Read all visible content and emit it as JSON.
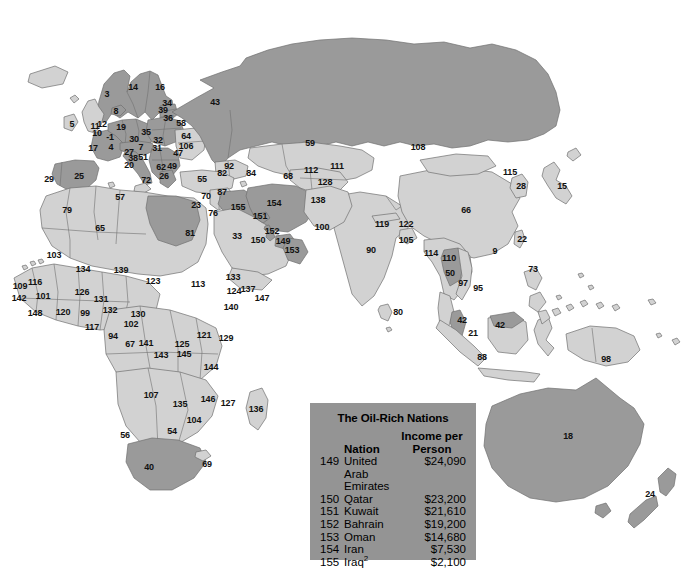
{
  "figure": {
    "kind": "world-map",
    "width": 693,
    "height": 579
  },
  "palette": {
    "ocean": "#ffffff",
    "land_light": "#d2d2d2",
    "land_dark": "#9a9a9a",
    "border": "#6e6e6e",
    "legend_bg": "#949494",
    "text": "#111111"
  },
  "legend": {
    "title": "The Oil-Rich Nations",
    "headers": {
      "rank": "",
      "nation": "Nation",
      "income_line1": "Income per",
      "income_line2": "Person"
    },
    "rows": [
      {
        "rank": "149",
        "nation": "United Arab Emirates",
        "income": "$24,090"
      },
      {
        "rank": "150",
        "nation": "Qatar",
        "income": "$23,200"
      },
      {
        "rank": "151",
        "nation": "Kuwait",
        "income": "$21,610"
      },
      {
        "rank": "152",
        "nation": "Bahrain",
        "income": "$19,200"
      },
      {
        "rank": "153",
        "nation": "Oman",
        "income": "$14,680"
      },
      {
        "rank": "154",
        "nation": "Iran",
        "income": "$7,530"
      },
      {
        "rank": "155",
        "nation": "Iraq",
        "income": "$2,100",
        "footnote": "2"
      }
    ]
  },
  "map_labels": [
    {
      "n": "5",
      "x": 72,
      "y": 124
    },
    {
      "n": "11",
      "x": 95,
      "y": 126
    },
    {
      "n": "3",
      "x": 107,
      "y": 94
    },
    {
      "n": "14",
      "x": 133,
      "y": 87
    },
    {
      "n": "16",
      "x": 160,
      "y": 87
    },
    {
      "n": "8",
      "x": 116,
      "y": 111
    },
    {
      "n": "12",
      "x": 102,
      "y": 124
    },
    {
      "n": "19",
      "x": 121,
      "y": 127
    },
    {
      "n": "34",
      "x": 167,
      "y": 103
    },
    {
      "n": "39",
      "x": 163,
      "y": 110
    },
    {
      "n": "36",
      "x": 168,
      "y": 118
    },
    {
      "n": "58",
      "x": 181,
      "y": 123
    },
    {
      "n": "43",
      "x": 215,
      "y": 102
    },
    {
      "n": "10",
      "x": 97,
      "y": 133
    },
    {
      "n": "-1",
      "x": 110,
      "y": 137
    },
    {
      "n": "35",
      "x": 146,
      "y": 132
    },
    {
      "n": "30",
      "x": 134,
      "y": 139
    },
    {
      "n": "32",
      "x": 158,
      "y": 140
    },
    {
      "n": "64",
      "x": 186,
      "y": 136
    },
    {
      "n": "106",
      "x": 186,
      "y": 146
    },
    {
      "n": "17",
      "x": 93,
      "y": 148
    },
    {
      "n": "4",
      "x": 111,
      "y": 147
    },
    {
      "n": "7",
      "x": 141,
      "y": 147
    },
    {
      "n": "31",
      "x": 157,
      "y": 148
    },
    {
      "n": "27",
      "x": 129,
      "y": 152
    },
    {
      "n": "47",
      "x": 178,
      "y": 153
    },
    {
      "n": "51",
      "x": 143,
      "y": 157
    },
    {
      "n": "38",
      "x": 133,
      "y": 158
    },
    {
      "n": "20",
      "x": 129,
      "y": 165
    },
    {
      "n": "62",
      "x": 161,
      "y": 167
    },
    {
      "n": "49",
      "x": 172,
      "y": 166
    },
    {
      "n": "26",
      "x": 164,
      "y": 176
    },
    {
      "n": "72",
      "x": 146,
      "y": 180
    },
    {
      "n": "29",
      "x": 49,
      "y": 179
    },
    {
      "n": "25",
      "x": 79,
      "y": 176
    },
    {
      "n": "55",
      "x": 202,
      "y": 179
    },
    {
      "n": "92",
      "x": 229,
      "y": 166
    },
    {
      "n": "82",
      "x": 222,
      "y": 173
    },
    {
      "n": "84",
      "x": 251,
      "y": 173
    },
    {
      "n": "68",
      "x": 288,
      "y": 176
    },
    {
      "n": "112",
      "x": 311,
      "y": 170
    },
    {
      "n": "111",
      "x": 337,
      "y": 166
    },
    {
      "n": "128",
      "x": 325,
      "y": 182
    },
    {
      "n": "59",
      "x": 310,
      "y": 143
    },
    {
      "n": "108",
      "x": 418,
      "y": 147
    },
    {
      "n": "115",
      "x": 510,
      "y": 172
    },
    {
      "n": "28",
      "x": 521,
      "y": 186
    },
    {
      "n": "15",
      "x": 562,
      "y": 186
    },
    {
      "n": "70",
      "x": 206,
      "y": 196
    },
    {
      "n": "87",
      "x": 222,
      "y": 192
    },
    {
      "n": "23",
      "x": 196,
      "y": 205
    },
    {
      "n": "76",
      "x": 213,
      "y": 213
    },
    {
      "n": "155",
      "x": 238,
      "y": 207
    },
    {
      "n": "151",
      "x": 260,
      "y": 216
    },
    {
      "n": "154",
      "x": 274,
      "y": 203
    },
    {
      "n": "138",
      "x": 318,
      "y": 200
    },
    {
      "n": "100",
      "x": 322,
      "y": 227
    },
    {
      "n": "119",
      "x": 382,
      "y": 224
    },
    {
      "n": "122",
      "x": 406,
      "y": 224
    },
    {
      "n": "105",
      "x": 406,
      "y": 240
    },
    {
      "n": "57",
      "x": 120,
      "y": 197
    },
    {
      "n": "79",
      "x": 67,
      "y": 210
    },
    {
      "n": "65",
      "x": 100,
      "y": 228
    },
    {
      "n": "81",
      "x": 190,
      "y": 233
    },
    {
      "n": "33",
      "x": 237,
      "y": 236
    },
    {
      "n": "150",
      "x": 258,
      "y": 240
    },
    {
      "n": "152",
      "x": 272,
      "y": 231
    },
    {
      "n": "149",
      "x": 283,
      "y": 241
    },
    {
      "n": "153",
      "x": 292,
      "y": 250
    },
    {
      "n": "66",
      "x": 466,
      "y": 210
    },
    {
      "n": "22",
      "x": 522,
      "y": 239
    },
    {
      "n": "9",
      "x": 495,
      "y": 251
    },
    {
      "n": "73",
      "x": 533,
      "y": 269
    },
    {
      "n": "90",
      "x": 371,
      "y": 250
    },
    {
      "n": "114",
      "x": 431,
      "y": 253
    },
    {
      "n": "110",
      "x": 449,
      "y": 258
    },
    {
      "n": "103",
      "x": 54,
      "y": 255
    },
    {
      "n": "134",
      "x": 83,
      "y": 269
    },
    {
      "n": "139",
      "x": 121,
      "y": 270
    },
    {
      "n": "123",
      "x": 153,
      "y": 281
    },
    {
      "n": "113",
      "x": 198,
      "y": 284
    },
    {
      "n": "133",
      "x": 233,
      "y": 277
    },
    {
      "n": "137",
      "x": 248,
      "y": 289
    },
    {
      "n": "124",
      "x": 234,
      "y": 291
    },
    {
      "n": "147",
      "x": 262,
      "y": 298
    },
    {
      "n": "140",
      "x": 231,
      "y": 307
    },
    {
      "n": "50",
      "x": 450,
      "y": 273
    },
    {
      "n": "97",
      "x": 463,
      "y": 283
    },
    {
      "n": "95",
      "x": 478,
      "y": 288
    },
    {
      "n": "109",
      "x": 20,
      "y": 286
    },
    {
      "n": "116",
      "x": 35,
      "y": 282
    },
    {
      "n": "142",
      "x": 19,
      "y": 298
    },
    {
      "n": "101",
      "x": 43,
      "y": 296
    },
    {
      "n": "126",
      "x": 82,
      "y": 292
    },
    {
      "n": "131",
      "x": 101,
      "y": 299
    },
    {
      "n": "132",
      "x": 110,
      "y": 310
    },
    {
      "n": "148",
      "x": 35,
      "y": 313
    },
    {
      "n": "120",
      "x": 63,
      "y": 312
    },
    {
      "n": "99",
      "x": 85,
      "y": 313
    },
    {
      "n": "117",
      "x": 92,
      "y": 327
    },
    {
      "n": "130",
      "x": 138,
      "y": 314
    },
    {
      "n": "102",
      "x": 131,
      "y": 324
    },
    {
      "n": "94",
      "x": 113,
      "y": 336
    },
    {
      "n": "67",
      "x": 130,
      "y": 344
    },
    {
      "n": "141",
      "x": 146,
      "y": 343
    },
    {
      "n": "121",
      "x": 204,
      "y": 335
    },
    {
      "n": "129",
      "x": 226,
      "y": 338
    },
    {
      "n": "125",
      "x": 182,
      "y": 344
    },
    {
      "n": "145",
      "x": 184,
      "y": 354
    },
    {
      "n": "143",
      "x": 161,
      "y": 355
    },
    {
      "n": "144",
      "x": 211,
      "y": 367
    },
    {
      "n": "80",
      "x": 398,
      "y": 312
    },
    {
      "n": "42",
      "x": 462,
      "y": 320
    },
    {
      "n": "21",
      "x": 473,
      "y": 333
    },
    {
      "n": "42b",
      "x": 500,
      "y": 325,
      "text": "42"
    },
    {
      "n": "88",
      "x": 482,
      "y": 357
    },
    {
      "n": "98",
      "x": 606,
      "y": 359
    },
    {
      "n": "107",
      "x": 151,
      "y": 395
    },
    {
      "n": "135",
      "x": 180,
      "y": 404
    },
    {
      "n": "146",
      "x": 208,
      "y": 399
    },
    {
      "n": "127",
      "x": 228,
      "y": 403
    },
    {
      "n": "104",
      "x": 194,
      "y": 420
    },
    {
      "n": "136",
      "x": 256,
      "y": 409
    },
    {
      "n": "56",
      "x": 125,
      "y": 435
    },
    {
      "n": "54",
      "x": 172,
      "y": 431
    },
    {
      "n": "40",
      "x": 149,
      "y": 467
    },
    {
      "n": "69",
      "x": 207,
      "y": 464
    },
    {
      "n": "18",
      "x": 568,
      "y": 436
    },
    {
      "n": "24",
      "x": 650,
      "y": 494
    }
  ]
}
